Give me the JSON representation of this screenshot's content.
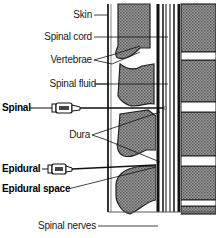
{
  "diagram": {
    "type": "anatomical-cross-section",
    "style": {
      "background": "#ffffff",
      "tissue_fill": "#808080",
      "line": "#111111"
    }
  },
  "labels": {
    "skin": "Skin",
    "spinal_cord": "Spinal cord",
    "vertebrae": "Vertebrae",
    "spinal_fluid": "Spinal fluid",
    "spinal": "Spinal",
    "dura": "Dura",
    "epidural": "Epidural",
    "epidural_space": "Epidural space",
    "spinal_nerves": "Spinal nerves"
  }
}
